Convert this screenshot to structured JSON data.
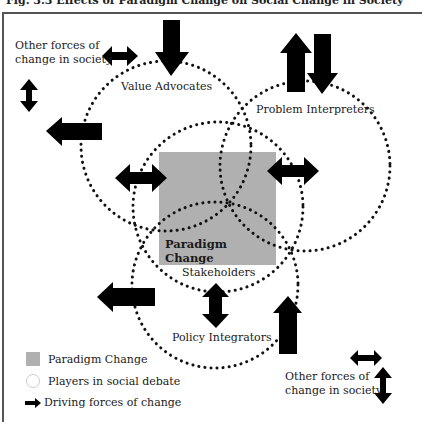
{
  "figure": {
    "title": "Fig. 3.3 Effects of Paradigm Change on Social Change in Society",
    "paradigm_box_label": "Paradigm\nChange",
    "paradigm_box_label_line1": "Paradigm",
    "paradigm_box_label_line2": "Change",
    "paradigm_box_color": "#b0b0b0",
    "arrow_color": "#000000",
    "circle_dot_color": "#111111"
  },
  "players": [
    {
      "label": "Value Advocates"
    },
    {
      "label": "Problem Interpreters"
    },
    {
      "label": "Stakeholders"
    },
    {
      "label": "Policy Integrators"
    }
  ],
  "other_forces": {
    "top_left_line1": "Other forces of",
    "top_left_line2": "change in society",
    "bottom_right_line1": "Other forces of",
    "bottom_right_line2": "change in society"
  },
  "legend": {
    "items": [
      {
        "icon": "grey-square",
        "label": "Paradigm Change"
      },
      {
        "icon": "dotted-circle",
        "label": "Players in social debate"
      },
      {
        "icon": "right-arrow",
        "label": "Driving forces of change"
      }
    ]
  }
}
